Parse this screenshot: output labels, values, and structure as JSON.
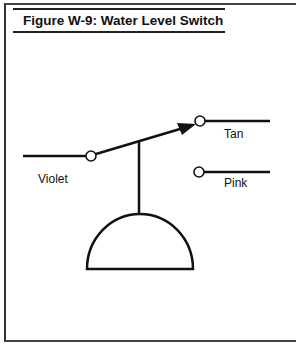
{
  "figure": {
    "title": "Figure W-9: Water Level Switch"
  },
  "diagram": {
    "type": "switch-schematic",
    "labels": {
      "common": "Violet",
      "upper_terminal": "Tan",
      "lower_terminal": "Pink"
    },
    "line_color": "#111111",
    "background": "#ffffff"
  }
}
